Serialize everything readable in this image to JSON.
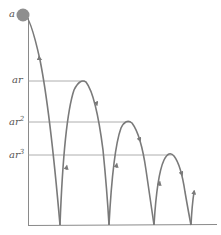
{
  "diagram": {
    "type": "bouncing-ball-heights",
    "colors": {
      "curve": "#7a7a7a",
      "axes": "#8a8a8a",
      "guides": "#9a9a9a",
      "ball": "#8f8f8f",
      "label": "#555555"
    },
    "labels": {
      "a": "a",
      "ar": "ar",
      "ar2_base": "ar",
      "ar2_exp": "2",
      "ar3_base": "ar",
      "ar3_exp": "3"
    },
    "levels": [
      {
        "name": "a",
        "y": 15
      },
      {
        "name": "ar",
        "y": 81
      },
      {
        "name": "ar^2",
        "y": 122
      },
      {
        "name": "ar^3",
        "y": 155
      }
    ],
    "bounce_points_x": [
      60,
      109,
      154,
      191
    ],
    "peaks": [
      {
        "x": 84,
        "y": 81
      },
      {
        "x": 130,
        "y": 122
      },
      {
        "x": 171,
        "y": 155
      }
    ]
  }
}
